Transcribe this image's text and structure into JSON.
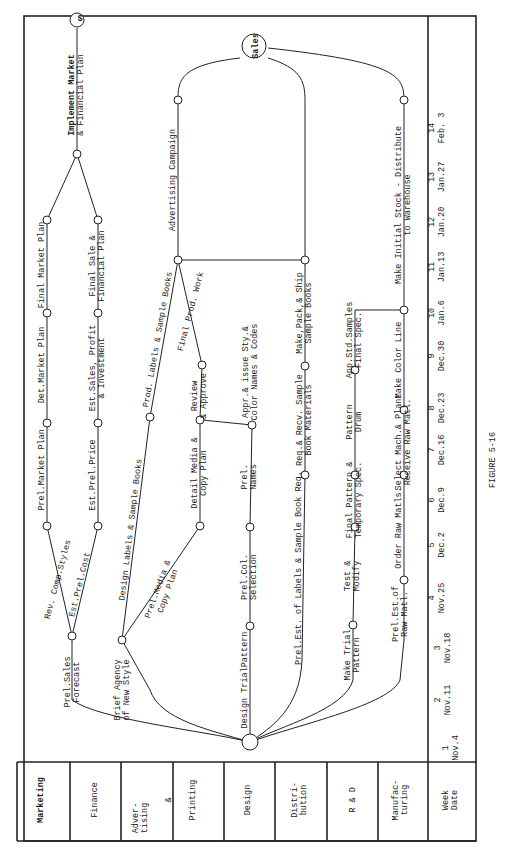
{
  "figure": {
    "caption": "FIGURE 5-16",
    "orientation": "rotated 90 degrees counter-clockwise"
  },
  "lanes": [
    {
      "label": "Marketing"
    },
    {
      "label": "Finance"
    },
    {
      "label": "Adver-\ntising\n&\nPrinting"
    },
    {
      "label": "Design"
    },
    {
      "label": "Distri-\nbution"
    },
    {
      "label": "R & D"
    },
    {
      "label": "Manufac-\nturing"
    }
  ],
  "timeline": {
    "header": "Week\nDate",
    "weeks": [
      {
        "week": "1",
        "date": "Nov.4"
      },
      {
        "week": "2",
        "date": "Nov.11"
      },
      {
        "week": "3",
        "date": "Nov.18"
      },
      {
        "week": "4",
        "date": "Nov.25"
      },
      {
        "week": "5",
        "date": "Dec.2"
      },
      {
        "week": "6",
        "date": "Dec.9"
      },
      {
        "week": "7",
        "date": "Dec.16"
      },
      {
        "week": "8",
        "date": "Dec.23"
      },
      {
        "week": "9",
        "date": "Dec.30"
      },
      {
        "week": "10",
        "date": "Jan.6"
      },
      {
        "week": "11",
        "date": "Jan.13"
      },
      {
        "week": "12",
        "date": "Jan.20"
      },
      {
        "week": "13",
        "date": "Jan.27"
      },
      {
        "week": "14",
        "date": "Feb. 3"
      }
    ]
  },
  "nodes": {
    "start": "",
    "sales": "Sales",
    "end": "$"
  },
  "activities": {
    "marketing": [
      "Prel.Sales\nForecast",
      "Rev. Comp.Styles",
      "Prel.Market Plan",
      "Det.Market Plan",
      "Final Market Plan",
      "Implement Market\n& Financial Plan"
    ],
    "finance": [
      "Est.Prel.Cost",
      "Est.Prel.Price",
      "Est.Sales, Profit\n& Investment",
      "Final Sale &\nFinancial Plan"
    ],
    "advertising": [
      "Brief Agency\nof New Style",
      "Design Labels & Sample Books",
      "Prel.Media &\nCopy Plan",
      "Detail Media &\nCopy Plan",
      "Review\n& Approve",
      "Prod. Labels & Sample Books",
      "Final Prod. Work",
      "Advertising Campaign"
    ],
    "design": [
      "Design TrialPattern",
      "Prel.Col.\nSelection",
      "Prel.\nNames",
      "Appr.& issue Sty.&\nColor Names & Codes"
    ],
    "distribution": [
      "Prel.Est. of Labels & Sample Book Req.",
      "Req.& Recv. Sample\nBook Materials",
      "Make,Pack,& Ship\nSample Books"
    ],
    "rnd": [
      "Make Trial\nPattern",
      "Test &\nModify",
      "Final Pattern &\nTemporary Spec.",
      "Pattern\nDrum",
      "App.Std.Samples\nFinal Spec."
    ],
    "manufacturing": [
      "Prel.Est.of\nRaw Matl.",
      "Order Raw Matls.",
      "Select Mach.& Plant\nReceive Raw Matl.",
      "Make Color Line",
      "Make Initial Stock - Distribute\nto Warehouse"
    ]
  }
}
